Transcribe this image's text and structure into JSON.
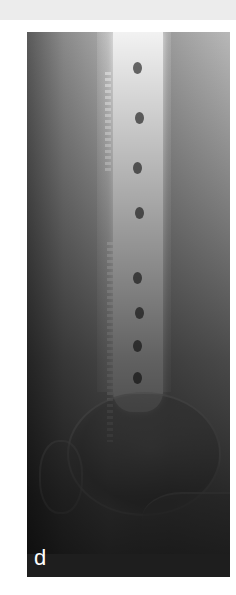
{
  "figure": {
    "panel_label": "d",
    "image_type": "lateral knee/distal femur radiograph with plate and screws",
    "colors": {
      "background": "#ffffff",
      "header_strip": "#ececec",
      "label_text": "#ffffff",
      "xray_dark": "#1e1e1e"
    }
  }
}
